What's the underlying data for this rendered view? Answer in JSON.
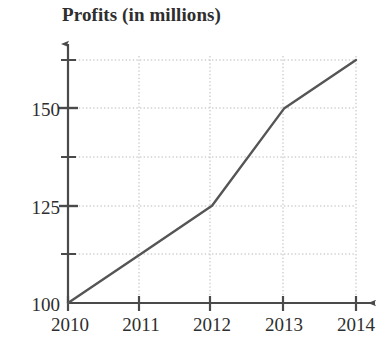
{
  "figure": {
    "title": "Profits (in millions)",
    "line_color": "#555555",
    "grid_color": "#b9b9b9",
    "axis_color": "#4a4a4a",
    "text_color": "#2e2e2e",
    "background": "#ffffff"
  },
  "axes": {
    "y_tick_labels": [
      "150",
      "125",
      "100"
    ],
    "x_tick_labels": [
      "2010",
      "2011",
      "2012",
      "2013",
      "2014"
    ]
  },
  "chart_data": {
    "type": "line",
    "title": "Profits (in millions)",
    "xlabel": "",
    "ylabel": "Profits (in millions)",
    "categories": [
      "2010",
      "2011",
      "2012",
      "2013",
      "2014"
    ],
    "x": [
      2010,
      2011,
      2012,
      2013,
      2014
    ],
    "values": [
      100,
      112.5,
      125,
      150,
      162.5
    ],
    "series": [
      {
        "name": "Profits",
        "values": [
          100,
          112.5,
          125,
          150,
          162.5
        ]
      }
    ],
    "xlim": [
      2010,
      2014
    ],
    "ylim": [
      100,
      162.5
    ],
    "y_labeled_ticks": [
      100,
      125,
      150
    ],
    "y_gridlines": [
      100,
      112.5,
      125,
      137.5,
      150,
      162.5
    ],
    "x_gridlines": [
      2011,
      2012,
      2013,
      2014
    ],
    "grid": true,
    "grid_style": "dotted",
    "legend": false,
    "legend_position": "none",
    "markers": false,
    "annotations": []
  }
}
